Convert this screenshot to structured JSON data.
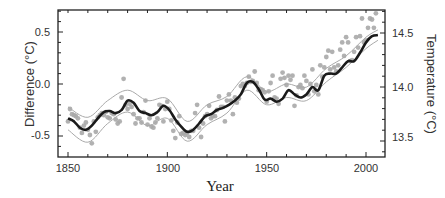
{
  "chart_data": {
    "type": "line",
    "title": "",
    "xlabel": "Year",
    "ylabel": "Difference (°C)",
    "ylabel_right": "Temperature (°C)",
    "xlim": [
      1845,
      2010
    ],
    "ylim": [
      -0.67,
      0.72
    ],
    "ylim_right": [
      13.33,
      14.72
    ],
    "x_ticks": [
      1850,
      1900,
      1950,
      2000
    ],
    "y_ticks": [
      -0.5,
      0.0,
      0.5
    ],
    "y_ticks_right": [
      13.5,
      14.0,
      14.5
    ],
    "grid": false,
    "legend": "none",
    "series": [
      {
        "name": "Smoothed annual mean (decadal)",
        "style": "thick black line",
        "x": [
          1850,
          1853,
          1856,
          1859,
          1862,
          1865,
          1868,
          1871,
          1874,
          1877,
          1880,
          1883,
          1886,
          1889,
          1892,
          1895,
          1898,
          1901,
          1904,
          1907,
          1910,
          1913,
          1916,
          1919,
          1922,
          1925,
          1928,
          1931,
          1934,
          1937,
          1940,
          1943,
          1946,
          1949,
          1952,
          1955,
          1958,
          1961,
          1964,
          1967,
          1970,
          1973,
          1976,
          1979,
          1982,
          1985,
          1988,
          1991,
          1994,
          1997,
          2000,
          2003,
          2006
        ],
        "values": [
          -0.33,
          -0.36,
          -0.42,
          -0.44,
          -0.4,
          -0.33,
          -0.27,
          -0.26,
          -0.28,
          -0.25,
          -0.16,
          -0.18,
          -0.26,
          -0.28,
          -0.3,
          -0.27,
          -0.21,
          -0.25,
          -0.34,
          -0.41,
          -0.46,
          -0.44,
          -0.38,
          -0.31,
          -0.29,
          -0.25,
          -0.23,
          -0.2,
          -0.16,
          -0.1,
          0.01,
          0.02,
          -0.05,
          -0.15,
          -0.14,
          -0.17,
          -0.14,
          -0.06,
          -0.1,
          -0.13,
          -0.1,
          -0.03,
          -0.06,
          0.08,
          0.1,
          0.1,
          0.16,
          0.22,
          0.22,
          0.3,
          0.4,
          0.46,
          0.47
        ]
      },
      {
        "name": "Upper uncertainty band",
        "style": "thin grey line",
        "x": [
          1850,
          1860,
          1870,
          1880,
          1890,
          1900,
          1910,
          1920,
          1930,
          1940,
          1950,
          1960,
          1970,
          1980,
          1990,
          2000,
          2006
        ],
        "values": [
          -0.22,
          -0.32,
          -0.16,
          -0.06,
          -0.16,
          -0.14,
          -0.36,
          -0.2,
          -0.12,
          0.07,
          -0.07,
          0.0,
          -0.03,
          0.15,
          0.27,
          0.45,
          0.52
        ]
      },
      {
        "name": "Lower uncertainty band",
        "style": "thin grey line",
        "x": [
          1850,
          1860,
          1870,
          1880,
          1890,
          1900,
          1910,
          1920,
          1930,
          1940,
          1950,
          1960,
          1970,
          1980,
          1990,
          2000,
          2006
        ],
        "values": [
          -0.44,
          -0.56,
          -0.38,
          -0.27,
          -0.4,
          -0.33,
          -0.55,
          -0.39,
          -0.28,
          -0.06,
          -0.2,
          -0.13,
          -0.16,
          0.02,
          0.16,
          0.34,
          0.42
        ]
      }
    ],
    "scatter": {
      "name": "Annual values",
      "style": "grey dots",
      "points": [
        [
          1850,
          -0.36
        ],
        [
          1851,
          -0.24
        ],
        [
          1852,
          -0.29
        ],
        [
          1853,
          -0.3
        ],
        [
          1854,
          -0.31
        ],
        [
          1855,
          -0.33
        ],
        [
          1856,
          -0.42
        ],
        [
          1857,
          -0.47
        ],
        [
          1858,
          -0.4
        ],
        [
          1859,
          -0.37
        ],
        [
          1860,
          -0.44
        ],
        [
          1861,
          -0.49
        ],
        [
          1862,
          -0.57
        ],
        [
          1863,
          -0.36
        ],
        [
          1864,
          -0.46
        ],
        [
          1865,
          -0.32
        ],
        [
          1866,
          -0.3
        ],
        [
          1867,
          -0.28
        ],
        [
          1868,
          -0.3
        ],
        [
          1869,
          -0.27
        ],
        [
          1870,
          -0.32
        ],
        [
          1871,
          -0.33
        ],
        [
          1872,
          -0.28
        ],
        [
          1873,
          -0.29
        ],
        [
          1874,
          -0.34
        ],
        [
          1875,
          -0.38
        ],
        [
          1876,
          -0.36
        ],
        [
          1877,
          -0.13
        ],
        [
          1878,
          0.05
        ],
        [
          1879,
          -0.2
        ],
        [
          1880,
          -0.24
        ],
        [
          1881,
          -0.19
        ],
        [
          1882,
          -0.22
        ],
        [
          1883,
          -0.29
        ],
        [
          1884,
          -0.38
        ],
        [
          1885,
          -0.33
        ],
        [
          1886,
          -0.33
        ],
        [
          1887,
          -0.37
        ],
        [
          1888,
          -0.27
        ],
        [
          1889,
          -0.16
        ],
        [
          1890,
          -0.39
        ],
        [
          1891,
          -0.33
        ],
        [
          1892,
          -0.41
        ],
        [
          1893,
          -0.42
        ],
        [
          1894,
          -0.37
        ],
        [
          1895,
          -0.33
        ],
        [
          1896,
          -0.2
        ],
        [
          1897,
          -0.21
        ],
        [
          1898,
          -0.36
        ],
        [
          1899,
          -0.24
        ],
        [
          1900,
          -0.17
        ],
        [
          1901,
          -0.24
        ],
        [
          1902,
          -0.35
        ],
        [
          1903,
          -0.45
        ],
        [
          1904,
          -0.52
        ],
        [
          1905,
          -0.37
        ],
        [
          1906,
          -0.31
        ],
        [
          1907,
          -0.48
        ],
        [
          1908,
          -0.47
        ],
        [
          1909,
          -0.49
        ],
        [
          1910,
          -0.47
        ],
        [
          1911,
          -0.51
        ],
        [
          1912,
          -0.45
        ],
        [
          1913,
          -0.45
        ],
        [
          1914,
          -0.28
        ],
        [
          1915,
          -0.2
        ],
        [
          1916,
          -0.42
        ],
        [
          1917,
          -0.51
        ],
        [
          1918,
          -0.38
        ],
        [
          1919,
          -0.31
        ],
        [
          1920,
          -0.29
        ],
        [
          1921,
          -0.21
        ],
        [
          1922,
          -0.33
        ],
        [
          1923,
          -0.31
        ],
        [
          1924,
          -0.31
        ],
        [
          1925,
          -0.25
        ],
        [
          1926,
          -0.12
        ],
        [
          1927,
          -0.22
        ],
        [
          1928,
          -0.22
        ],
        [
          1929,
          -0.36
        ],
        [
          1930,
          -0.16
        ],
        [
          1931,
          -0.1
        ],
        [
          1932,
          -0.16
        ],
        [
          1933,
          -0.29
        ],
        [
          1934,
          -0.13
        ],
        [
          1935,
          -0.18
        ],
        [
          1936,
          -0.14
        ],
        [
          1937,
          -0.02
        ],
        [
          1938,
          0.0
        ],
        [
          1939,
          -0.02
        ],
        [
          1940,
          0.01
        ],
        [
          1941,
          0.07
        ],
        [
          1942,
          0.02
        ],
        [
          1943,
          0.03
        ],
        [
          1944,
          0.12
        ],
        [
          1945,
          0.01
        ],
        [
          1946,
          -0.06
        ],
        [
          1947,
          -0.05
        ],
        [
          1948,
          -0.06
        ],
        [
          1949,
          -0.08
        ],
        [
          1950,
          -0.17
        ],
        [
          1951,
          -0.07
        ],
        [
          1952,
          0.01
        ],
        [
          1953,
          0.08
        ],
        [
          1954,
          -0.13
        ],
        [
          1955,
          -0.14
        ],
        [
          1956,
          -0.19
        ],
        [
          1957,
          0.05
        ],
        [
          1958,
          0.11
        ],
        [
          1959,
          0.06
        ],
        [
          1960,
          -0.01
        ],
        [
          1961,
          0.08
        ],
        [
          1962,
          0.04
        ],
        [
          1963,
          0.08
        ],
        [
          1964,
          -0.21
        ],
        [
          1965,
          -0.11
        ],
        [
          1966,
          -0.03
        ],
        [
          1967,
          -0.01
        ],
        [
          1968,
          -0.04
        ],
        [
          1969,
          0.08
        ],
        [
          1970,
          0.03
        ],
        [
          1971,
          -0.1
        ],
        [
          1972,
          0.0
        ],
        [
          1973,
          0.14
        ],
        [
          1974,
          -0.07
        ],
        [
          1975,
          -0.01
        ],
        [
          1976,
          -0.1
        ],
        [
          1977,
          0.18
        ],
        [
          1978,
          0.07
        ],
        [
          1979,
          0.16
        ],
        [
          1980,
          0.26
        ],
        [
          1981,
          0.32
        ],
        [
          1982,
          0.14
        ],
        [
          1983,
          0.31
        ],
        [
          1984,
          0.16
        ],
        [
          1985,
          0.12
        ],
        [
          1986,
          0.18
        ],
        [
          1987,
          0.33
        ],
        [
          1988,
          0.4
        ],
        [
          1989,
          0.27
        ],
        [
          1990,
          0.45
        ],
        [
          1991,
          0.4
        ],
        [
          1992,
          0.22
        ],
        [
          1993,
          0.23
        ],
        [
          1994,
          0.31
        ],
        [
          1995,
          0.45
        ],
        [
          1996,
          0.35
        ],
        [
          1997,
          0.46
        ],
        [
          1998,
          0.63
        ],
        [
          1999,
          0.4
        ],
        [
          2000,
          0.42
        ],
        [
          2001,
          0.54
        ],
        [
          2002,
          0.63
        ],
        [
          2003,
          0.62
        ],
        [
          2004,
          0.54
        ],
        [
          2005,
          0.68
        ]
      ]
    },
    "annotations": []
  },
  "axes": {
    "left_title": "Difference (°C)",
    "right_title": "Temperature (°C)",
    "bottom_title": "Year",
    "left_ticks": [
      "0.5",
      "0.0",
      "-0.5"
    ],
    "right_ticks": [
      "14.5",
      "14.0",
      "13.5"
    ],
    "bottom_ticks": [
      "1850",
      "1900",
      "1950",
      "2000"
    ]
  },
  "colors": {
    "smooth_line": "#1a1a1a",
    "band_line": "#aaaaaa",
    "dots": "#a8a8a8",
    "axis": "#222222"
  }
}
